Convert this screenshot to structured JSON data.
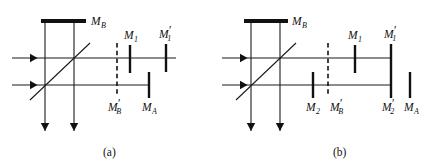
{
  "figure": {
    "panels": [
      {
        "id": "a",
        "caption": "(a)",
        "caption_pos": {
          "x": 103,
          "y": 156
        },
        "origin_x": 0,
        "beams": [
          {
            "name": "upper-input-beam",
            "x1": 12,
            "y1": 58,
            "x2": 176,
            "y2": 58,
            "arrow": "right",
            "arrow_x": 30,
            "arrow_y": 58
          },
          {
            "name": "lower-input-beam",
            "x1": 12,
            "y1": 85,
            "x2": 150,
            "y2": 85,
            "arrow": "right",
            "arrow_x": 30,
            "arrow_y": 85
          },
          {
            "name": "left-output-beam",
            "x1": 45,
            "y1": 20,
            "x2": 45,
            "y2": 131,
            "arrow": "down",
            "arrow_x": 45,
            "arrow_y": 131
          },
          {
            "name": "right-output-beam",
            "x1": 74,
            "y1": 20,
            "x2": 74,
            "y2": 131,
            "arrow": "down",
            "arrow_x": 74,
            "arrow_y": 131
          }
        ],
        "beamsplitter": {
          "name": "beamsplitter",
          "x1": 30,
          "y1": 100,
          "x2": 90,
          "y2": 43
        },
        "mirrors": [
          {
            "name": "mirror-MB",
            "style": "thick",
            "orient": "h",
            "x1": 41,
            "y1": 21,
            "x2": 86,
            "y2": 21,
            "label": "M",
            "sub": "B",
            "prime": false,
            "label_x": 91,
            "label_y": 25
          },
          {
            "name": "mirror-MB-prime",
            "style": "dashed",
            "orient": "v",
            "x1": 117,
            "y1": 43,
            "x2": 117,
            "y2": 95,
            "label": "M",
            "sub": "B",
            "prime": true,
            "label_x": 108,
            "label_y": 111
          },
          {
            "name": "mirror-M1",
            "style": "thin",
            "orient": "v",
            "x1": 130,
            "y1": 45,
            "x2": 130,
            "y2": 73,
            "label": "M",
            "sub": "1",
            "prime": false,
            "label_x": 124,
            "label_y": 39
          },
          {
            "name": "mirror-M1-prime",
            "style": "thin",
            "orient": "v",
            "x1": 166,
            "y1": 44,
            "x2": 166,
            "y2": 72,
            "label": "M",
            "sub": "1",
            "prime": true,
            "label_x": 159,
            "label_y": 38
          },
          {
            "name": "mirror-MA",
            "style": "thin",
            "orient": "v",
            "x1": 149,
            "y1": 72,
            "x2": 149,
            "y2": 98,
            "label": "M",
            "sub": "A",
            "prime": false,
            "label_x": 142,
            "label_y": 111
          }
        ]
      },
      {
        "id": "b",
        "caption": "(b)",
        "caption_pos": {
          "x": 333,
          "y": 156
        },
        "origin_x": 217,
        "beams": [
          {
            "name": "upper-input-beam",
            "x1": 222,
            "y1": 58,
            "x2": 392,
            "y2": 58,
            "arrow": "right",
            "arrow_x": 240,
            "arrow_y": 58
          },
          {
            "name": "lower-input-beam",
            "x1": 222,
            "y1": 85,
            "x2": 392,
            "y2": 85,
            "arrow": "right",
            "arrow_x": 240,
            "arrow_y": 85
          },
          {
            "name": "left-output-beam",
            "x1": 251,
            "y1": 20,
            "x2": 251,
            "y2": 131,
            "arrow": "down",
            "arrow_x": 251,
            "arrow_y": 131
          },
          {
            "name": "right-output-beam",
            "x1": 280,
            "y1": 20,
            "x2": 280,
            "y2": 131,
            "arrow": "down",
            "arrow_x": 280,
            "arrow_y": 131
          }
        ],
        "beamsplitter": {
          "name": "beamsplitter",
          "x1": 236,
          "y1": 100,
          "x2": 296,
          "y2": 43
        },
        "mirrors": [
          {
            "name": "mirror-MB",
            "style": "thick",
            "orient": "h",
            "x1": 244,
            "y1": 21,
            "x2": 288,
            "y2": 21,
            "label": "M",
            "sub": "B",
            "prime": false,
            "label_x": 292,
            "label_y": 25
          },
          {
            "name": "mirror-M2",
            "style": "thin",
            "orient": "v",
            "x1": 313,
            "y1": 72,
            "x2": 313,
            "y2": 98,
            "label": "M",
            "sub": "2",
            "prime": false,
            "label_x": 306,
            "label_y": 111
          },
          {
            "name": "mirror-MB-prime",
            "style": "dashed",
            "orient": "v",
            "x1": 328,
            "y1": 43,
            "x2": 328,
            "y2": 95,
            "label": "M",
            "sub": "B",
            "prime": true,
            "label_x": 330,
            "label_y": 111
          },
          {
            "name": "mirror-M1",
            "style": "thin",
            "orient": "v",
            "x1": 355,
            "y1": 45,
            "x2": 355,
            "y2": 73,
            "label": "M",
            "sub": "1",
            "prime": false,
            "label_x": 348,
            "label_y": 39
          },
          {
            "name": "mirror-M1-prime",
            "style": "thin",
            "orient": "v",
            "x1": 391,
            "y1": 44,
            "x2": 391,
            "y2": 72,
            "label": "M",
            "sub": "1",
            "prime": true,
            "label_x": 384,
            "label_y": 38
          },
          {
            "name": "mirror-M2-prime",
            "style": "thin",
            "orient": "v",
            "x1": 391,
            "y1": 72,
            "x2": 391,
            "y2": 98,
            "label": "M",
            "sub": "2",
            "prime": true,
            "label_x": 382,
            "label_y": 111
          },
          {
            "name": "mirror-MA",
            "style": "thin",
            "orient": "v",
            "x1": 410,
            "y1": 72,
            "x2": 410,
            "y2": 98,
            "label": "M",
            "sub": "A",
            "prime": false,
            "label_x": 404,
            "label_y": 111
          }
        ]
      }
    ],
    "colors": {
      "ink": "#111111",
      "beam": "#1a1a1a",
      "background": "#ffffff"
    }
  }
}
